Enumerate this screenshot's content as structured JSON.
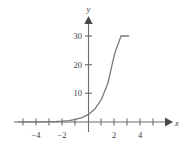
{
  "chart_data": {
    "type": "line",
    "title": "",
    "subtitle": "",
    "xlabel": "x",
    "ylabel": "y",
    "xlim": [
      -5.6,
      6.0
    ],
    "ylim": [
      -3.5,
      33.5
    ],
    "grid": false,
    "legend": null,
    "annotations": [],
    "x_ticks": [
      -5,
      -4,
      -3,
      -2,
      -1,
      1,
      2,
      3,
      4,
      5
    ],
    "x_tick_labels": [
      {
        "value": -4,
        "label": "−4"
      },
      {
        "value": -2,
        "label": "−2"
      },
      {
        "value": 2,
        "label": "2"
      },
      {
        "value": 4,
        "label": "4"
      }
    ],
    "y_ticks": [
      10,
      20,
      30
    ],
    "y_tick_labels": [
      {
        "value": 10,
        "label": "10"
      },
      {
        "value": 20,
        "label": "20"
      },
      {
        "value": 30,
        "label": "30"
      }
    ],
    "axis_arrows": {
      "x": "right",
      "y": "up"
    },
    "series": [
      {
        "name": "exponential",
        "color": "#7a7a7a",
        "x": [
          -5.4,
          -5.0,
          -4.5,
          -4.0,
          -3.5,
          -3.0,
          -2.5,
          -2.0,
          -1.5,
          -1.0,
          -0.5,
          0.0,
          0.5,
          1.0,
          1.5,
          2.0,
          2.5,
          2.75,
          3.0,
          3.1
        ],
        "values": [
          0.01,
          0.01,
          0.02,
          0.04,
          0.06,
          0.1,
          0.17,
          0.3,
          0.51,
          0.89,
          1.53,
          2.65,
          4.59,
          7.94,
          13.7,
          23.7,
          30.0,
          30.0,
          30.0,
          30.0
        ]
      }
    ]
  },
  "axis_labels": {
    "x": "x",
    "y": "y"
  },
  "ticks": {
    "x_neg_4": "−4",
    "x_neg_2": "−2",
    "x_pos_2": "2",
    "x_pos_4": "4",
    "y_10": "10",
    "y_20": "20",
    "y_30": "30"
  },
  "colors": {
    "axis": "#6b6b6b",
    "curve": "#7a7a7a",
    "text": "#3d3d3d",
    "background": "#ffffff"
  }
}
